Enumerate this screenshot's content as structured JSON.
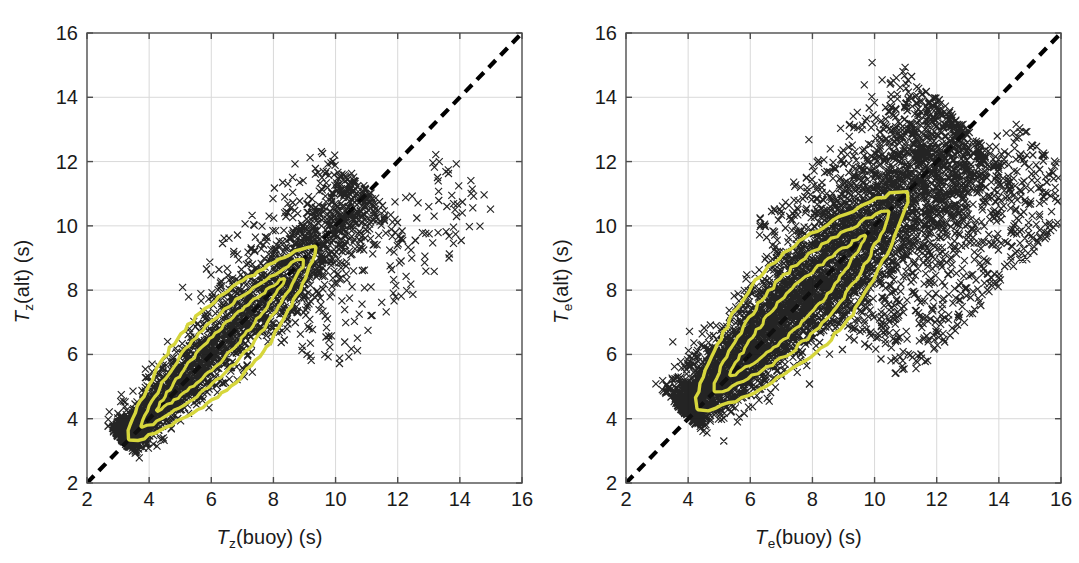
{
  "figure": {
    "background": "#ffffff",
    "panel_count": 2
  },
  "style": {
    "marker_color": "#111111",
    "contour_color": "#d6d63c",
    "reference_line_color": "#000000",
    "grid_color": "#d9d9d9",
    "axis_color": "#4d4d4d",
    "tick_label_color": "#1a1a1a"
  },
  "panels": [
    {
      "id": "left",
      "xlabel_var": "T",
      "xlabel_sub": "z",
      "xlabel_rest": "(buoy) (s)",
      "ylabel_var": "T",
      "ylabel_sub": "z",
      "ylabel_rest": "(alt) (s)",
      "xticks": [
        "2",
        "4",
        "6",
        "8",
        "10",
        "12",
        "14",
        "16"
      ],
      "yticks": [
        "2",
        "4",
        "6",
        "8",
        "10",
        "12",
        "14",
        "16"
      ]
    },
    {
      "id": "right",
      "xlabel_var": "T",
      "xlabel_sub": "e",
      "xlabel_rest": "(buoy) (s)",
      "ylabel_var": "T",
      "ylabel_sub": "e",
      "ylabel_rest": "(alt) (s)",
      "xticks": [
        "2",
        "4",
        "6",
        "8",
        "10",
        "12",
        "14",
        "16"
      ],
      "yticks": [
        "2",
        "4",
        "6",
        "8",
        "10",
        "12",
        "14",
        "16"
      ]
    }
  ],
  "chart_data": [
    {
      "type": "scatter",
      "panel": "left",
      "title": "",
      "xlabel": "Tz(buoy) (s)",
      "ylabel": "Tz(alt) (s)",
      "xlim": [
        2,
        16
      ],
      "ylim": [
        2,
        16
      ],
      "xticks": [
        2,
        4,
        6,
        8,
        10,
        12,
        14,
        16
      ],
      "yticks": [
        2,
        4,
        6,
        8,
        10,
        12,
        14,
        16
      ],
      "grid": true,
      "legend": "none",
      "marker": "x",
      "annotations": [
        "dashed 1:1 reference line from (2,2) to (16,16)"
      ],
      "overlays": [
        {
          "kind": "density-contour",
          "color": "#d6d63c",
          "levels": 3,
          "description": "Three nested yellow density contours enclosing the cloud core, elongated along the 1:1 line between about (3.5,3.8) and (9.3,9.2)"
        }
      ],
      "cloud": {
        "description": "Dense elongated scatter cloud along the 1:1 line; core runs from about (3,3.5) to (10.5,10.5) with a sparse tail of outliers to x=13.5",
        "x_range_observed": [
          2.7,
          13.5
        ],
        "y_range_observed": [
          3.1,
          11.5
        ],
        "core_center": [
          6.3,
          6.2
        ],
        "major_axis_slope": 1.0,
        "spread_minor": 0.55,
        "n_points_approx": 2400,
        "outlier_fraction": 0.06
      }
    },
    {
      "type": "scatter",
      "panel": "right",
      "title": "",
      "xlabel": "Te(buoy) (s)",
      "ylabel": "Te(alt) (s)",
      "xlim": [
        2,
        16
      ],
      "ylim": [
        2,
        16
      ],
      "xticks": [
        2,
        4,
        6,
        8,
        10,
        12,
        14,
        16
      ],
      "yticks": [
        2,
        4,
        6,
        8,
        10,
        12,
        14,
        16
      ],
      "grid": true,
      "legend": "none",
      "marker": "x",
      "annotations": [
        "dashed 1:1 reference line from (2,2) to (16,16)"
      ],
      "overlays": [
        {
          "kind": "density-contour",
          "color": "#d6d63c",
          "levels": 3,
          "description": "Three nested yellow density contours enclosing the cloud core, elongated along the 1:1 line between about (4.0,4.9) and (10.7,11.1)"
        }
      ],
      "cloud": {
        "description": "Dense elongated scatter cloud along the 1:1 line shifted slightly above it; core runs from about (3.5,4.2) to (12,12.5) with a broad cluster of outliers below the line out to x=16",
        "x_range_observed": [
          3.2,
          16.0
        ],
        "y_range_observed": [
          3.6,
          15.0
        ],
        "core_center": [
          8.0,
          8.3
        ],
        "major_axis_slope": 1.0,
        "spread_minor": 0.8,
        "n_points_approx": 5200,
        "outlier_fraction": 0.14
      }
    }
  ]
}
